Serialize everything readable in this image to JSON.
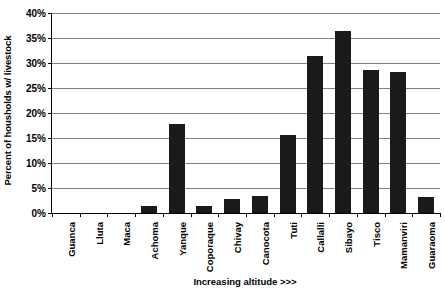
{
  "chart_data": {
    "type": "bar",
    "title": "",
    "xlabel": "Increasing altitude >>>",
    "ylabel": "Percent of housholds w/ livestock",
    "categories": [
      "Guanca",
      "Lluta",
      "Maca",
      "Achoma",
      "Yanque",
      "Coporaque",
      "Chivay",
      "Canocota",
      "Tuti",
      "Callalli",
      "Sibayo",
      "Tisco",
      "Mamanviri",
      "Guaraoma"
    ],
    "values": [
      0,
      0,
      0,
      1.5,
      17.8,
      1.5,
      2.9,
      3.5,
      15.6,
      31.5,
      36.5,
      28.7,
      28.2,
      3.3
    ],
    "ylim": [
      0,
      40
    ],
    "ytick_labels": [
      "0%",
      "5%",
      "10%",
      "15%",
      "20%",
      "25%",
      "30%",
      "35%",
      "40%"
    ],
    "ytick_values": [
      0,
      5,
      10,
      15,
      20,
      25,
      30,
      35,
      40
    ],
    "grid": true,
    "legend": false,
    "bar_color": "#1a1a1a",
    "grid_color": "#808080",
    "axis_color": "#000000"
  }
}
